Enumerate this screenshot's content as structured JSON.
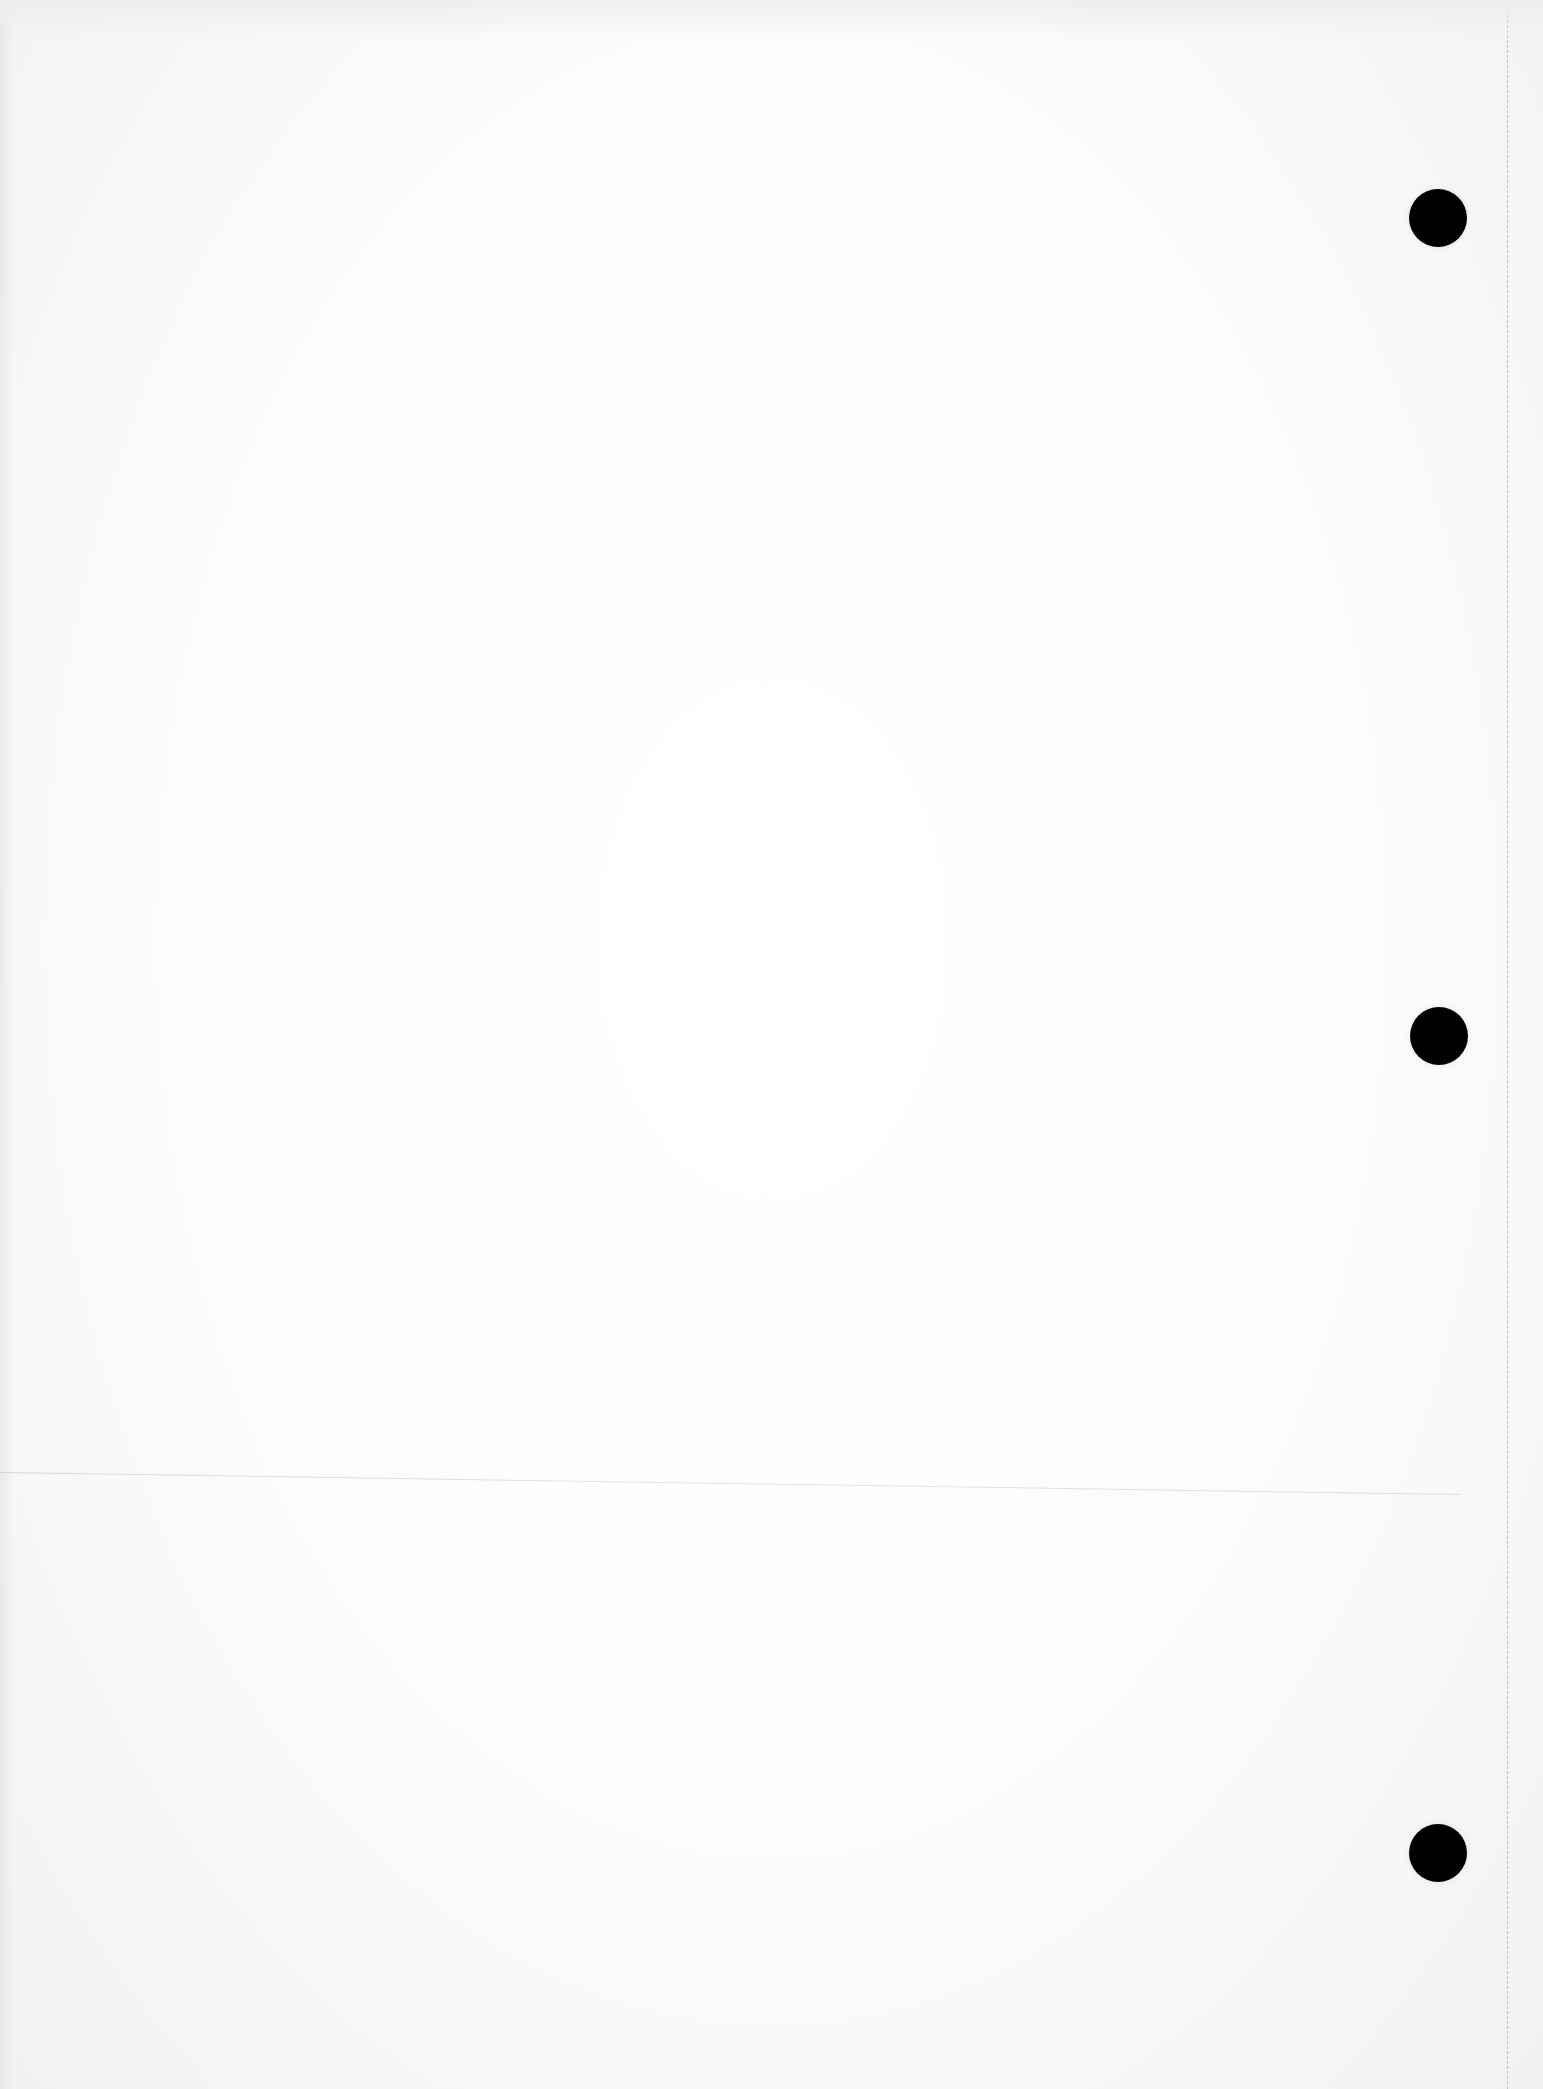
{
  "page": {
    "background_color": "#fdfdfd",
    "content_text": ""
  },
  "punch_holes": [
    {
      "cx": 1438,
      "cy": 218,
      "diameter": 58,
      "color": "#000000"
    },
    {
      "cx": 1439,
      "cy": 1036,
      "diameter": 58,
      "color": "#000000"
    },
    {
      "cx": 1438,
      "cy": 1853,
      "diameter": 58,
      "color": "#000000"
    }
  ],
  "perforation_edge": {
    "x": 1507,
    "style": "dashed",
    "color": "#bdbdbd"
  },
  "faint_rule": {
    "x1": 0,
    "y1": 1472,
    "x2": 1460,
    "y2": 1494,
    "color": "#d9d9d9"
  }
}
